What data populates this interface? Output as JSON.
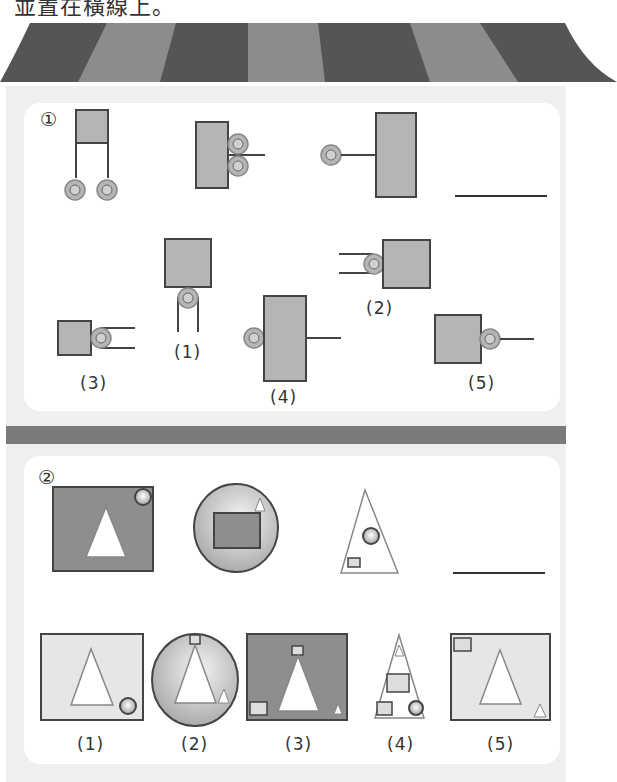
{
  "header": {
    "instruction_fragment": "並置在橫線上。"
  },
  "colors": {
    "awning_dark": "#555555",
    "awning_light": "#8c8c8c",
    "wall": "#efefef",
    "card": "#ffffff",
    "divider": "#7a7a7a",
    "shape_fill": "#b5b5b5",
    "shape_stroke": "#444444",
    "light_fill": "#e6e6e6"
  },
  "question1": {
    "number": "①",
    "sequence_items": [
      "square-with-two-hanging-pulleys",
      "rect-with-two-pulleys-right-and-line",
      "pulley-line-to-tall-rect",
      "answer-blank"
    ],
    "options": [
      {
        "label": "(1)",
        "desc": "square with pulley below and two hanging lines"
      },
      {
        "label": "(2)",
        "desc": "pulley with two lines on left of square"
      },
      {
        "label": "(3)",
        "desc": "square with pulley and two lines on right"
      },
      {
        "label": "(4)",
        "desc": "pulley left of tall rect with line on right"
      },
      {
        "label": "(5)",
        "desc": "square with pulley and single line on right"
      }
    ]
  },
  "question2": {
    "number": "②",
    "sequence_items": [
      "gray-square-white-triangle-circle",
      "circle-with-rect-and-small-triangle",
      "triangle-with-circle-and-small-rect",
      "answer-blank"
    ],
    "options": [
      {
        "label": "(1)",
        "desc": "light square with triangle and circle"
      },
      {
        "label": "(2)",
        "desc": "circle with triangle, small square and small triangle"
      },
      {
        "label": "(3)",
        "desc": "dark square with triangle, small squares and small triangle"
      },
      {
        "label": "(4)",
        "desc": "triangle with small triangle, rectangles and circle"
      },
      {
        "label": "(5)",
        "desc": "light square with triangle, small square and small triangle"
      }
    ]
  }
}
